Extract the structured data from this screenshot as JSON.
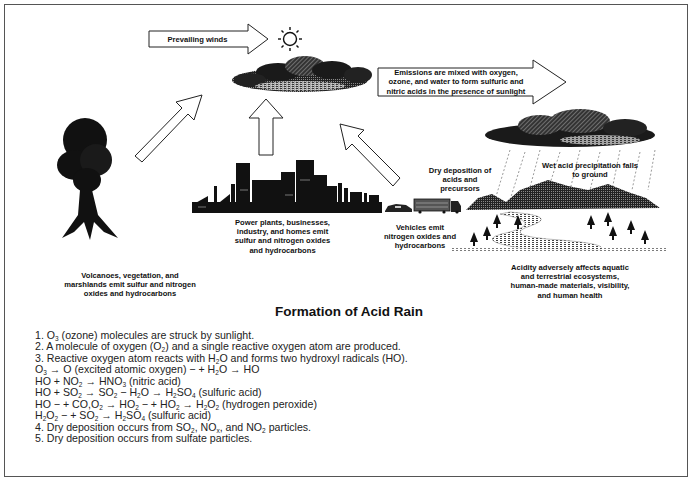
{
  "diagram": {
    "title": "Formation of Acid Rain",
    "arrows": {
      "prevailing_winds": "Prevailing winds",
      "emissions_mixed": "Emissions are mixed with oxygen,\nozone, and water to form sulfuric and\nnitric acids in the presence of sunlight"
    },
    "labels": {
      "volcanoes": "Volcanoes, vegetation, and\nmarshlands emit sulfur and nitrogen\noxides and hydrocarbons",
      "power_plants": "Power plants, businesses,\nindustry, and homes emit\nsulfur and nitrogen oxides\nand hydrocarbons",
      "vehicles": "Vehicles emit\nnitrogen oxides and\nhydrocarbons",
      "dry_deposition": "Dry deposition of\nacids and\nprecursors",
      "wet_precipitation": "Wet acid precipitation falls\nto ground",
      "acidity_effects": "Acidity adversely affects aquatic\nand terrestrial ecosystems,\nhuman-made materials, visibility,\nand human health"
    },
    "icons": [
      "sun-icon",
      "cloud-icon",
      "volcano-icon",
      "city-skyline-icon",
      "car-icon",
      "truck-icon",
      "rain-cloud-icon",
      "mountains-icon",
      "tree-icon",
      "river-icon"
    ],
    "colors": {
      "ink": "#111111",
      "border": "#555555",
      "background": "#ffffff"
    }
  },
  "steps": [
    {
      "id": "1",
      "parts": [
        "1. O",
        "3",
        " (ozone) molecules are struck by sunlight."
      ]
    },
    {
      "id": "2",
      "parts": [
        "2. A molecule of oxygen (O",
        "2",
        ") and a single reactive oxygen atom are produced."
      ]
    },
    {
      "id": "3",
      "parts": [
        "3. Reactive oxygen atom reacts with H",
        "2",
        "O and forms two hydroxyl radicals (HO)."
      ]
    },
    {
      "id": "eq1",
      "parts": [
        "O",
        "3",
        " → O (excited atomic oxygen) − + H",
        "2",
        "O → HO"
      ]
    },
    {
      "id": "eq2",
      "parts": [
        "HO + NO",
        "2",
        " → HNO",
        "3",
        " (nitric acid)"
      ]
    },
    {
      "id": "eq3",
      "parts": [
        "HO + SO",
        "2",
        " → SO",
        "2",
        " − H",
        "2",
        "O → H",
        "2",
        "SO",
        "4",
        " (sulfuric acid)"
      ]
    },
    {
      "id": "eq4",
      "parts": [
        "HO − + CO,O",
        "2",
        " → HO",
        "2",
        " − + HO",
        "2",
        " → H",
        "2",
        "O",
        "2",
        " (hydrogen peroxide)"
      ]
    },
    {
      "id": "eq5",
      "parts": [
        "H",
        "2",
        "O",
        "2",
        " − + SO",
        "2",
        " → H",
        "2",
        "SO",
        "4",
        " (sulfuric acid)"
      ]
    },
    {
      "id": "4",
      "parts": [
        "4. Dry deposition occurs from SO",
        "2",
        ", NO",
        "x",
        ", and NO",
        "2",
        " particles."
      ]
    },
    {
      "id": "5",
      "parts": [
        "5. Dry deposition occurs from sulfate particles."
      ]
    }
  ]
}
